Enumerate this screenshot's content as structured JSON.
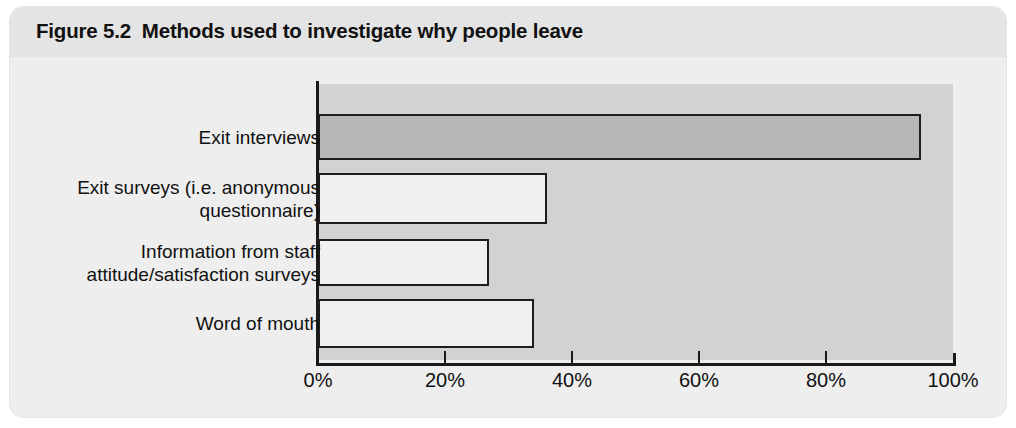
{
  "figure": {
    "title": "Figure 5.2  Methods used to investigate why people leave",
    "background_color": "#eeeeee",
    "title_band_color": "#e4e4e4"
  },
  "chart_data": {
    "type": "bar",
    "orientation": "horizontal",
    "title": "Figure 5.2  Methods used to investigate why people leave",
    "xlabel": "",
    "ylabel": "",
    "categories": [
      "Exit interviews",
      "Exit surveys (i.e. anonymous\nquestionnaire)",
      "Information from staff\nattitude/satisfaction surveys",
      "Word of mouth"
    ],
    "values": [
      95,
      36,
      27,
      34
    ],
    "value_unit": "%",
    "xlim": [
      0,
      100
    ],
    "xticks": [
      0,
      20,
      40,
      60,
      80,
      100
    ],
    "xtick_labels": [
      "0%",
      "20%",
      "40%",
      "60%",
      "80%",
      "100%"
    ],
    "grid": false,
    "legend": false,
    "plot_background_color": "#d2d2d2",
    "bar_colors": [
      "#b6b6b6",
      "#f0f0f0",
      "#f0f0f0",
      "#f0f0f0"
    ],
    "bar_border_color": "#1d1d1d",
    "axis_color": "#1a1a1a"
  }
}
